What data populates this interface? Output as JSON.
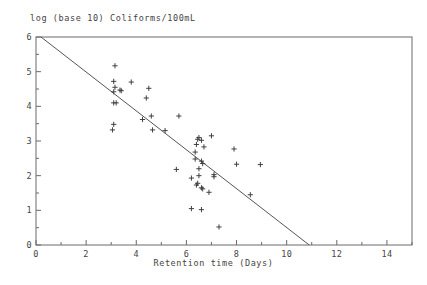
{
  "chart_data": {
    "type": "scatter",
    "title": "log (base 10) Coliforms/100mL",
    "xlabel": "Retention time (Days)",
    "ylabel": "",
    "xlim": [
      0,
      15
    ],
    "ylim": [
      0,
      6
    ],
    "grid": false,
    "legend": null,
    "marker": "plus",
    "marker_color": "#404040",
    "axis_color": "#6a6a6a",
    "background_color": "#ffffff",
    "xticks": [
      0,
      2,
      4,
      6,
      8,
      10,
      12,
      14
    ],
    "xtick_labels": [
      "0",
      "2",
      "4",
      "6",
      "8",
      "10",
      "12",
      "14"
    ],
    "xminor_ticks": [
      1,
      3,
      5,
      7,
      9,
      11,
      13,
      15
    ],
    "yticks": [
      0,
      1,
      2,
      3,
      4,
      5,
      6
    ],
    "ytick_labels": [
      "0",
      "1",
      "2",
      "3",
      "4",
      "5",
      "6"
    ],
    "yminor_ticks": [
      0.5,
      1.5,
      2.5,
      3.5,
      4.5,
      5.5
    ],
    "points": [
      {
        "x": 3.15,
        "y": 5.17
      },
      {
        "x": 3.1,
        "y": 4.72
      },
      {
        "x": 3.15,
        "y": 4.55
      },
      {
        "x": 3.1,
        "y": 4.42
      },
      {
        "x": 3.35,
        "y": 4.47
      },
      {
        "x": 3.4,
        "y": 4.45
      },
      {
        "x": 3.8,
        "y": 4.7
      },
      {
        "x": 4.5,
        "y": 4.52
      },
      {
        "x": 4.4,
        "y": 4.24
      },
      {
        "x": 3.1,
        "y": 4.1
      },
      {
        "x": 3.2,
        "y": 4.1
      },
      {
        "x": 4.6,
        "y": 3.72
      },
      {
        "x": 4.25,
        "y": 3.62
      },
      {
        "x": 3.1,
        "y": 3.48
      },
      {
        "x": 3.05,
        "y": 3.32
      },
      {
        "x": 4.65,
        "y": 3.32
      },
      {
        "x": 5.15,
        "y": 3.3
      },
      {
        "x": 5.7,
        "y": 3.72
      },
      {
        "x": 6.5,
        "y": 3.1
      },
      {
        "x": 6.45,
        "y": 3.05
      },
      {
        "x": 6.6,
        "y": 3.02
      },
      {
        "x": 6.4,
        "y": 2.9
      },
      {
        "x": 7.0,
        "y": 3.15
      },
      {
        "x": 6.7,
        "y": 2.83
      },
      {
        "x": 6.35,
        "y": 2.68
      },
      {
        "x": 7.9,
        "y": 2.77
      },
      {
        "x": 6.35,
        "y": 2.48
      },
      {
        "x": 6.6,
        "y": 2.42
      },
      {
        "x": 6.65,
        "y": 2.35
      },
      {
        "x": 8.0,
        "y": 2.33
      },
      {
        "x": 8.95,
        "y": 2.32
      },
      {
        "x": 5.6,
        "y": 2.18
      },
      {
        "x": 6.5,
        "y": 2.2
      },
      {
        "x": 7.1,
        "y": 2.03
      },
      {
        "x": 7.1,
        "y": 1.97
      },
      {
        "x": 6.5,
        "y": 2.0
      },
      {
        "x": 6.2,
        "y": 1.93
      },
      {
        "x": 6.45,
        "y": 1.78
      },
      {
        "x": 6.4,
        "y": 1.73
      },
      {
        "x": 6.6,
        "y": 1.65
      },
      {
        "x": 6.65,
        "y": 1.62
      },
      {
        "x": 6.9,
        "y": 1.52
      },
      {
        "x": 8.55,
        "y": 1.45
      },
      {
        "x": 6.2,
        "y": 1.05
      },
      {
        "x": 6.6,
        "y": 1.02
      },
      {
        "x": 7.3,
        "y": 0.52
      }
    ],
    "fit_line": {
      "label": "regression line",
      "x_start": 0.2,
      "y_start": 6.0,
      "x_end": 10.9,
      "y_end": 0.0,
      "color": "#555555"
    }
  }
}
